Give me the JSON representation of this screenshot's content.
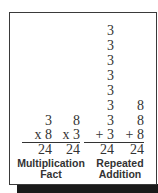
{
  "colors": {
    "text": "#333333",
    "border": "#3a3a3a",
    "shadow": "#1a1a1a",
    "background": "#ffffff"
  },
  "multiplication_fact": {
    "label_line1": "Multiplication",
    "label_line2": "Fact",
    "problems": [
      {
        "top": "3",
        "operator_line": "x 8",
        "result": "24"
      },
      {
        "top": "8",
        "operator_line": "x 3",
        "result": "24"
      }
    ]
  },
  "repeated_addition": {
    "label_line1": "Repeated",
    "label_line2": "Addition",
    "threes": {
      "addends": [
        "3",
        "3",
        "3",
        "3",
        "3",
        "3",
        "3"
      ],
      "last": "+ 3",
      "result": "24"
    },
    "eights": {
      "addends": [
        "8",
        "8"
      ],
      "last": "+ 8",
      "result": "24"
    }
  }
}
